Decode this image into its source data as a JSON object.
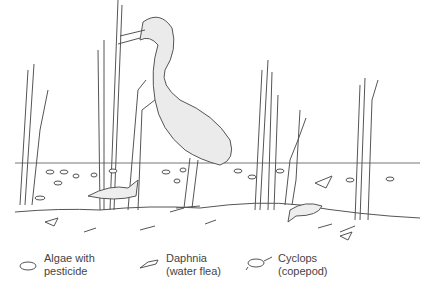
{
  "diagram": {
    "colors": {
      "line": "#555555",
      "bird_fill": "#e8e8e8",
      "water_line": "#777777",
      "background": "#ffffff"
    }
  },
  "legend": [
    {
      "icon": "algae-icon",
      "line1": "Algae with",
      "line2": "pesticide"
    },
    {
      "icon": "daphnia-icon",
      "line1": "Daphnia",
      "line2": "(water flea)"
    },
    {
      "icon": "cyclops-icon",
      "line1": "Cyclops",
      "line2": "(copepod)"
    }
  ]
}
